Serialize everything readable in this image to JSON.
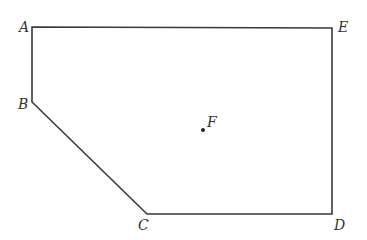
{
  "figure": {
    "type": "polygon",
    "stroke_color": "#3a3a3a",
    "point_color": "#222222",
    "vertices": [
      {
        "name": "A",
        "x": 32,
        "y": 27,
        "label_x": 19,
        "label_y": 32
      },
      {
        "name": "E",
        "x": 332,
        "y": 28,
        "label_x": 338,
        "label_y": 32
      },
      {
        "name": "D",
        "x": 332,
        "y": 214,
        "label_x": 334,
        "label_y": 230
      },
      {
        "name": "C",
        "x": 147,
        "y": 214,
        "label_x": 138,
        "label_y": 230
      },
      {
        "name": "B",
        "x": 32,
        "y": 102,
        "label_x": 18,
        "label_y": 109
      }
    ],
    "interior_point": {
      "name": "F",
      "x": 203,
      "y": 130,
      "label_x": 207,
      "label_y": 127
    }
  },
  "labels": {
    "A": "A",
    "B": "B",
    "C": "C",
    "D": "D",
    "E": "E",
    "F": "F"
  }
}
